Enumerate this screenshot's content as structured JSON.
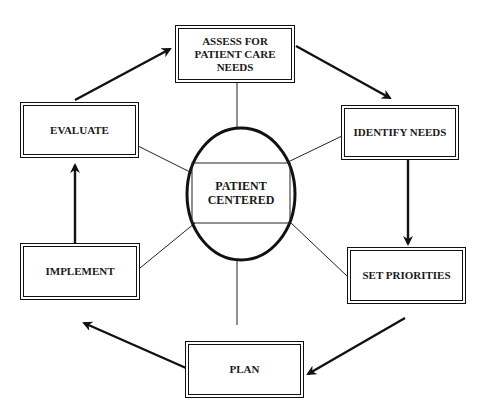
{
  "diagram": {
    "type": "cycle",
    "center": {
      "label": "PATIENT\nCENTERED"
    },
    "nodes": [
      {
        "id": "assess",
        "label": "ASSESS FOR\nPATIENT CARE\nNEEDS"
      },
      {
        "id": "identify",
        "label": "IDENTIFY NEEDS"
      },
      {
        "id": "priorities",
        "label": "SET PRIORITIES"
      },
      {
        "id": "plan",
        "label": "PLAN"
      },
      {
        "id": "implement",
        "label": "IMPLEMENT"
      },
      {
        "id": "evaluate",
        "label": "EVALUATE"
      }
    ],
    "edges": [
      {
        "from": "assess",
        "to": "identify",
        "kind": "arrow"
      },
      {
        "from": "identify",
        "to": "priorities",
        "kind": "arrow"
      },
      {
        "from": "priorities",
        "to": "plan",
        "kind": "arrow"
      },
      {
        "from": "plan",
        "to": "implement",
        "kind": "arrow"
      },
      {
        "from": "implement",
        "to": "evaluate",
        "kind": "arrow"
      },
      {
        "from": "evaluate",
        "to": "assess",
        "kind": "arrow"
      }
    ],
    "spokes": [
      "assess",
      "identify",
      "priorities",
      "plan",
      "implement",
      "evaluate"
    ],
    "colors": {
      "stroke": "#111111",
      "background": "#ffffff",
      "text": "#1a1a1a"
    }
  }
}
